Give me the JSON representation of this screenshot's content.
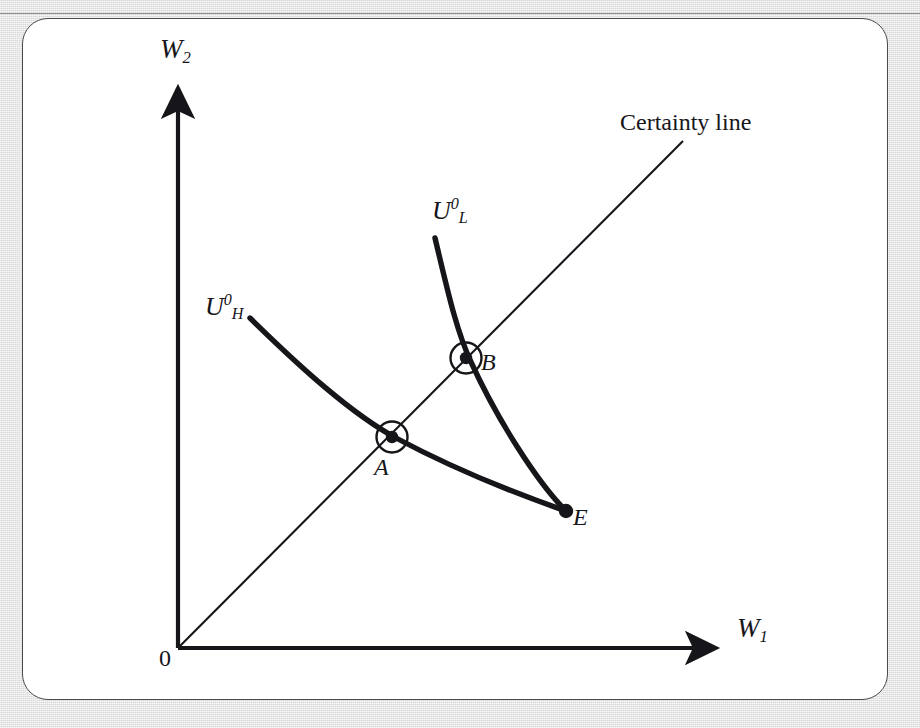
{
  "figure": {
    "kind": "economics-diagram",
    "background_color": "#dcdcdc",
    "panel_color": "#ffffff",
    "ink_color": "#16161a"
  },
  "axes": {
    "y_label": {
      "symbol": "W",
      "subscript": "2"
    },
    "x_label": {
      "symbol": "W",
      "subscript": "1"
    },
    "origin_label": "0"
  },
  "annotations": {
    "certainty_line": "Certainty line"
  },
  "curves": [
    {
      "name": "high-risk-indifference-curve",
      "label": {
        "symbol": "U",
        "superscript": "0",
        "subscript": "H"
      },
      "style": "thick",
      "description": "Flatter convex curve from upper-left through A down to E"
    },
    {
      "name": "low-risk-indifference-curve",
      "label": {
        "symbol": "U",
        "superscript": "0",
        "subscript": "L"
      },
      "style": "thick",
      "description": "Steeper convex curve from top through B down to E"
    }
  ],
  "points": [
    {
      "name": "point-a",
      "label": "A",
      "marker": "circled-dot",
      "on": "certainty line and high-risk curve"
    },
    {
      "name": "point-b",
      "label": "B",
      "marker": "circled-dot",
      "on": "certainty line and low-risk curve"
    },
    {
      "name": "point-e",
      "label": "E",
      "marker": "dot",
      "on": "endowment where both curves meet"
    }
  ]
}
